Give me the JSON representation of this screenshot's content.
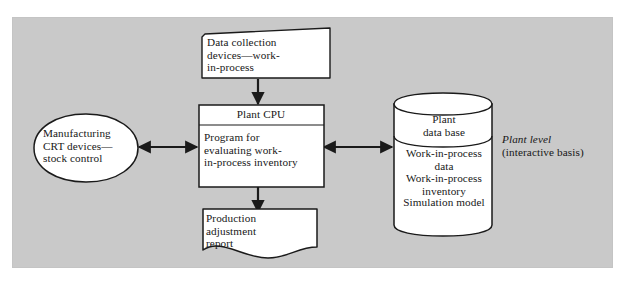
{
  "diagram": {
    "title_annotation": {
      "level": "Plant level",
      "mode": "(interactive basis)"
    },
    "nodes": {
      "data_collection": {
        "shape": "skewed-input-box",
        "label": "Data collection\ndevices—work-\nin-process"
      },
      "plant_cpu": {
        "shape": "process-box",
        "header": "Plant CPU",
        "body": "Program for\nevaluating work-\nin-process inventory"
      },
      "crt_devices": {
        "shape": "pointed-oval",
        "label": "Manufacturing\nCRT devices—\nstock control"
      },
      "plant_database": {
        "shape": "cylinder",
        "header": "Plant\ndata base",
        "body_1": "Work-in-process\ndata\nWork-in-process\ninventory",
        "body_2": "Simulation model"
      },
      "production_report": {
        "shape": "document",
        "label": "Production\nadjustment\nreport"
      }
    },
    "edges": [
      {
        "from": "data_collection",
        "to": "plant_cpu",
        "direction": "down"
      },
      {
        "from": "plant_cpu",
        "to": "production_report",
        "direction": "down"
      },
      {
        "from": "crt_devices",
        "to": "plant_cpu",
        "direction": "both"
      },
      {
        "from": "plant_cpu",
        "to": "plant_database",
        "direction": "both"
      }
    ],
    "colors": {
      "panel_background": "#c9c9c9",
      "node_fill": "#ffffff",
      "stroke": "#1a1a1a",
      "text": "#171717",
      "page_background": "#ffffff"
    }
  }
}
